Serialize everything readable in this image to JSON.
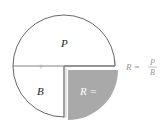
{
  "diagram": {
    "colors": {
      "outline": "#555555",
      "shaded": "#a9a9a9",
      "shaded_text": "#ffffff",
      "formula_text": "#9a9a9a",
      "divider": "#777777"
    },
    "labels": {
      "top_half": "P",
      "bottom_left": "B",
      "bottom_right": "R ="
    },
    "formula": {
      "lhs": "R =",
      "numerator": "P",
      "denominator": "B"
    },
    "center_mark": "+"
  }
}
